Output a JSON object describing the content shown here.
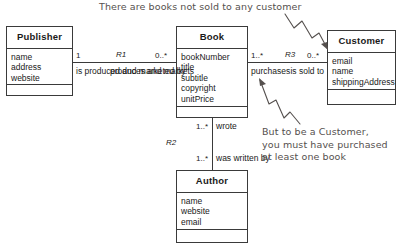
{
  "diagram": {
    "classes": {
      "publisher": {
        "name": "Publisher",
        "attributes": [
          "name",
          "address",
          "website"
        ],
        "operations": []
      },
      "book": {
        "name": "Book",
        "attributes": [
          "bookNumber",
          "title",
          "subtitle",
          "copyright",
          "unitPrice"
        ],
        "operations": []
      },
      "customer": {
        "name": "Customer",
        "attributes": [
          "email",
          "name",
          "shippingAddress"
        ],
        "operations": []
      },
      "author": {
        "name": "Author",
        "attributes": [
          "name",
          "website",
          "email"
        ],
        "operations": []
      }
    },
    "associations": {
      "r1": {
        "label": "R1",
        "left_multiplicity": "1",
        "right_multiplicity": "0..*",
        "left_role": "is produced\nand\nmarketed\nby",
        "right_role": "produces\nand\nmarkets"
      },
      "r3": {
        "label": "R3",
        "left_multiplicity": "1..*",
        "right_multiplicity": "0..*",
        "left_role": "purchases",
        "right_role": "is\nsold to"
      },
      "r2": {
        "label": "R2",
        "top_multiplicity": "1..*",
        "bottom_multiplicity": "1..*",
        "top_role": "wrote",
        "bottom_role": "was written by"
      }
    },
    "annotations": {
      "top": "There are books not sold to any customer",
      "right": "But to be a Customer,\nyou must have purchased\nat least one book"
    },
    "colors": {
      "stroke": "#3a3a3a",
      "text": "#1a1a1a",
      "annotation": "#55504e",
      "background": "#ffffff"
    }
  }
}
